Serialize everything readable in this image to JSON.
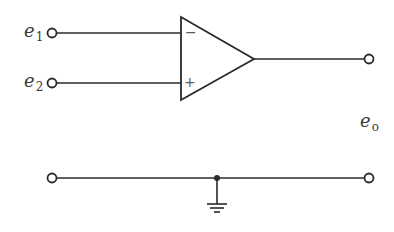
{
  "diagram": {
    "title": "",
    "type": "op-amp circuit schematic",
    "stroke_color": "#2a2a2a",
    "label_color": "#3a3a3a",
    "labels": {
      "input1": {
        "base": "e",
        "sub": "1"
      },
      "input2": {
        "base": "e",
        "sub": "2"
      },
      "output": {
        "base": "e",
        "sub": "o"
      }
    },
    "opamp": {
      "inverting_sign": "−",
      "noninverting_sign": "+"
    },
    "components": [
      "input-terminal-e1",
      "input-terminal-e2",
      "op-amp",
      "output-terminal",
      "common-terminal-left",
      "common-terminal-right",
      "junction-dot",
      "ground"
    ]
  }
}
